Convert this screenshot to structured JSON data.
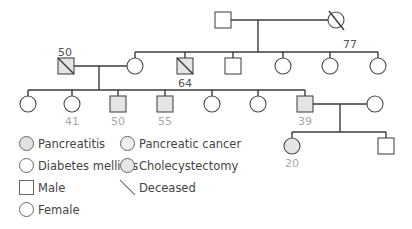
{
  "colors": {
    "line": "#3a3a3a",
    "pancreatitis": "#e2e2e2",
    "diabetes_mellitus": "#ffffff",
    "pancreatic_cancer": "#eeeeee",
    "cholecystectomy": "#e6e6e6",
    "affected_fill": "#e4e4e4"
  },
  "pedigree": {
    "generation_1": [
      {
        "sex": "male",
        "deceased": false,
        "age": ""
      },
      {
        "sex": "female",
        "deceased": true,
        "age": "77"
      }
    ],
    "generation_2": [
      {
        "sex": "male",
        "deceased": true,
        "age": "50",
        "spouse_of": "generation_2 female child 1"
      },
      {
        "sex": "female",
        "deceased": false,
        "age": ""
      },
      {
        "sex": "male",
        "deceased": true,
        "age": "64"
      },
      {
        "sex": "male",
        "deceased": false,
        "age": ""
      },
      {
        "sex": "female",
        "deceased": false,
        "age": ""
      },
      {
        "sex": "female",
        "deceased": false,
        "age": ""
      },
      {
        "sex": "female",
        "deceased": false,
        "age": ""
      }
    ],
    "generation_3": [
      {
        "sex": "female",
        "affected": false,
        "age": ""
      },
      {
        "sex": "female",
        "affected": false,
        "age": "41"
      },
      {
        "sex": "male",
        "affected": true,
        "age": "50"
      },
      {
        "sex": "male",
        "affected": true,
        "age": "55"
      },
      {
        "sex": "female",
        "affected": false,
        "age": ""
      },
      {
        "sex": "female",
        "affected": false,
        "age": ""
      },
      {
        "sex": "male",
        "affected": true,
        "age": "39"
      },
      {
        "sex": "female",
        "affected": false,
        "age": "",
        "role": "spouse"
      }
    ],
    "generation_4": [
      {
        "sex": "female",
        "affected": true,
        "age": "20"
      },
      {
        "sex": "male",
        "affected": false,
        "age": ""
      }
    ]
  },
  "labels": {
    "g1_female_age": "77",
    "g2_father_age": "50",
    "g2_brother_age": "64",
    "g3_age_41": "41",
    "g3_age_50": "50",
    "g3_age_55": "55",
    "g3_age_39": "39",
    "g4_age_20": "20"
  },
  "legend": {
    "pancreatitis": "Pancreatitis",
    "pancreatic_cancer": "Pancreatic cancer",
    "diabetes_mellitus": "Diabetes mellitus",
    "cholecystectomy": "Cholecystectomy",
    "male": "Male",
    "deceased": "Deceased",
    "female": "Female"
  }
}
